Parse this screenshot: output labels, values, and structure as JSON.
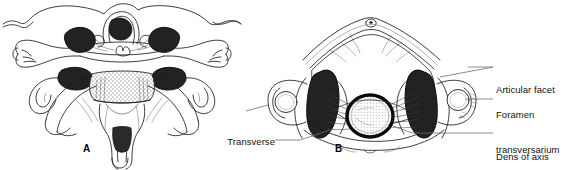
{
  "figure": {
    "kind": "anatomical-line-drawing",
    "background_color": "#ffffff",
    "ink_color": "#1a1a1a",
    "facet_fill_color": "#232323",
    "leader_line_color": "#6e6e6e"
  },
  "panels": [
    {
      "id": "A",
      "letter": "A",
      "view": "posterior view of articulated atlas and axis"
    },
    {
      "id": "B",
      "letter": "B",
      "view": "superior view of atlas with dens and transverse ligament"
    }
  ],
  "labels": [
    {
      "id": "transverse-ligament-of-atlas",
      "lines": [
        "Transverse",
        "ligament",
        "of atlas"
      ],
      "text": "Transverse ligament of atlas",
      "align": "right"
    },
    {
      "id": "articular-facet",
      "lines": [
        "Articular facet"
      ],
      "text": "Articular facet",
      "align": "left"
    },
    {
      "id": "foramen-transversarium",
      "lines": [
        "Foramen",
        "transversarium"
      ],
      "text": "Foramen transversarium",
      "align": "left"
    },
    {
      "id": "dens-of-axis",
      "lines": [
        "Dens of axis"
      ],
      "text": "Dens of axis",
      "align": "left"
    }
  ]
}
